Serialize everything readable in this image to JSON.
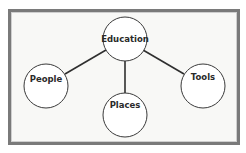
{
  "diagram": {
    "type": "hub-and-spoke concept map",
    "colors": {
      "frame_border": "#7a7a7a",
      "frame_background": "#f8f8f6",
      "node_fill": "#ffffff",
      "node_stroke": "#3a3a3a",
      "edge": "#2f2f2f",
      "text": "#2a2a2a"
    },
    "nodes": [
      {
        "id": "education",
        "label": "Education",
        "role": "center"
      },
      {
        "id": "people",
        "label": "People",
        "role": "child"
      },
      {
        "id": "places",
        "label": "Places",
        "role": "child"
      },
      {
        "id": "tools",
        "label": "Tools",
        "role": "child"
      }
    ],
    "edges": [
      {
        "from": "Education",
        "to": "People"
      },
      {
        "from": "Education",
        "to": "Places"
      },
      {
        "from": "Education",
        "to": "Tools"
      }
    ]
  }
}
